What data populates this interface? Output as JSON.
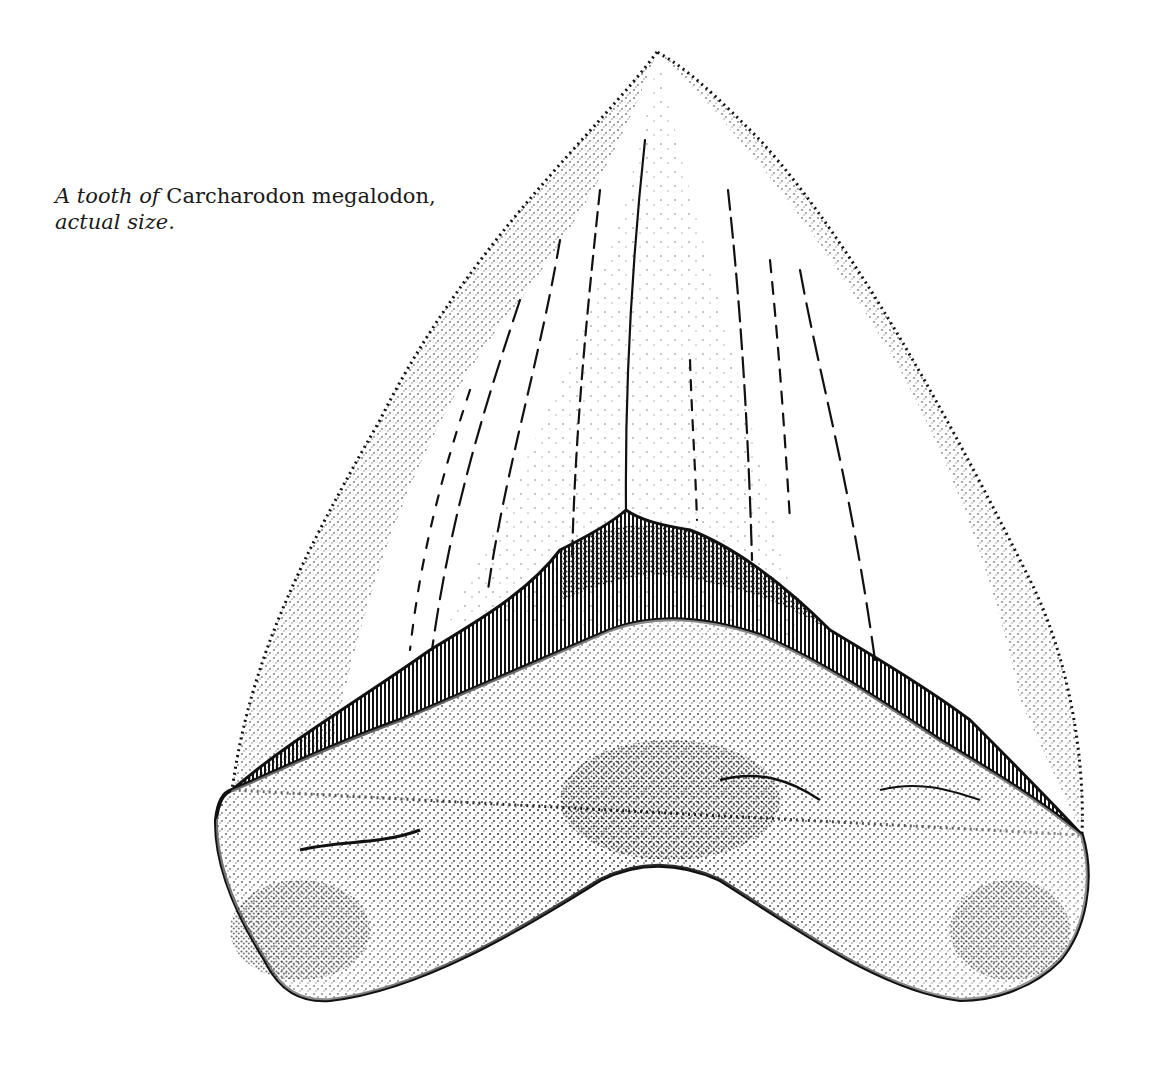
{
  "caption": {
    "line1_italic_prefix": "A tooth of",
    "line1_roman": "Carcharodon megalodon,",
    "line2_italic": "actual size."
  },
  "illustration": {
    "subject": "megalodon-tooth-stipple-drawing",
    "colors": {
      "ink": "#111111",
      "paper": "#ffffff"
    }
  }
}
